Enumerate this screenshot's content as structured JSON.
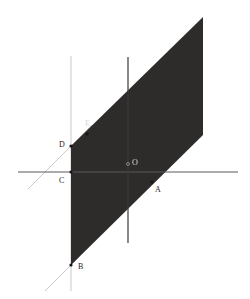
{
  "figure": {
    "width": 250,
    "height": 299,
    "background_color": "#ffffff"
  },
  "colors": {
    "region_fill": "#2e2b2b",
    "axis_stroke": "#5a5a5a",
    "helper_line_stroke": "#c9c9c9",
    "vertical_axis_stroke": "#3a3a3a",
    "label_text": "#1d1d1d",
    "label_text_on_dark": "#d8d8d8"
  },
  "shaded_region": {
    "name": "shaded-parallelogram",
    "fill": "#2e2b2b",
    "opacity": 1,
    "vertices": [
      {
        "x": 71,
        "y": 146
      },
      {
        "x": 203,
        "y": 17
      },
      {
        "x": 203,
        "y": 135
      },
      {
        "x": 71,
        "y": 265
      }
    ]
  },
  "lines": [
    {
      "name": "x-axis",
      "x1": 18,
      "y1": 172,
      "x2": 238,
      "y2": 172,
      "stroke": "#5a5a5a",
      "stroke_width": 1.1
    },
    {
      "name": "y-axis",
      "x1": 128,
      "y1": 57,
      "x2": 128,
      "y2": 243,
      "stroke": "#3a3a3a",
      "stroke_width": 1.2
    },
    {
      "name": "vertical-helper-line",
      "x1": 71,
      "y1": 56,
      "x2": 71,
      "y2": 291,
      "stroke": "#c9c9c9",
      "stroke_width": 1.0
    },
    {
      "name": "diagonal-helper-line",
      "x1": 28,
      "y1": 189,
      "x2": 92,
      "y2": 125,
      "stroke": "#c9c9c9",
      "stroke_width": 1.0
    },
    {
      "name": "diagonal-helper-line-lower",
      "x1": 45,
      "y1": 291,
      "x2": 79,
      "y2": 257,
      "stroke": "#c9c9c9",
      "stroke_width": 1.0
    }
  ],
  "points": [
    {
      "id": "E",
      "label": "E",
      "marker_x": 87,
      "marker_y": 134,
      "label_x": 85,
      "label_y": 120,
      "on_dark": true,
      "marker_visible": true
    },
    {
      "id": "D",
      "label": "D",
      "marker_x": 71,
      "marker_y": 146,
      "label_x": 59,
      "label_y": 141,
      "on_dark": false,
      "marker_visible": true
    },
    {
      "id": "C",
      "label": "C",
      "marker_x": 71,
      "marker_y": 172,
      "label_x": 59,
      "label_y": 177,
      "on_dark": false,
      "marker_visible": true
    },
    {
      "id": "O",
      "label": "O",
      "marker_x": 128,
      "marker_y": 164,
      "label_x": 132,
      "label_y": 159,
      "on_dark": true,
      "marker_visible": true
    },
    {
      "id": "A",
      "label": "A",
      "marker_x": 152,
      "marker_y": 182,
      "label_x": 155,
      "label_y": 186,
      "on_dark": false,
      "marker_visible": true
    },
    {
      "id": "B",
      "label": "B",
      "marker_x": 71,
      "marker_y": 265,
      "label_x": 78,
      "label_y": 263,
      "on_dark": false,
      "marker_visible": true
    }
  ]
}
